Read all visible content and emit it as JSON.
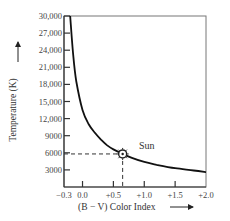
{
  "chart_data": {
    "type": "line",
    "title": "",
    "xlabel": "(B − V) Color Index",
    "ylabel": "Temperature (K)",
    "xlim": [
      -0.3,
      2.0
    ],
    "ylim": [
      0,
      30000
    ],
    "x_ticks": [
      "−0.3",
      "0.0",
      "+0.5",
      "+1.0",
      "+1.5",
      "+2.0"
    ],
    "x_tick_values": [
      -0.3,
      0.0,
      0.5,
      1.0,
      1.5,
      2.0
    ],
    "y_ticks": [
      "3000",
      "6000",
      "9000",
      "12,000",
      "15,000",
      "18,000",
      "21,000",
      "24,000",
      "27,000",
      "30,000"
    ],
    "y_tick_values": [
      3000,
      6000,
      9000,
      12000,
      15000,
      18000,
      21000,
      24000,
      27000,
      30000
    ],
    "grid": false,
    "legend": null,
    "series": [
      {
        "name": "Temperature vs. color index",
        "x": [
          -0.2,
          -0.15,
          -0.1,
          0.0,
          0.1,
          0.2,
          0.3,
          0.4,
          0.5,
          0.65,
          0.8,
          1.0,
          1.2,
          1.5,
          1.8,
          2.0
        ],
        "values": [
          30000,
          23000,
          18500,
          13500,
          11000,
          9500,
          8300,
          7300,
          6600,
          5800,
          5100,
          4400,
          3900,
          3300,
          2900,
          2600
        ]
      }
    ],
    "annotations": [
      {
        "label": "Sun",
        "x": 0.65,
        "y": 5800,
        "marker": "sun-symbol",
        "dashed_guides": true
      }
    ]
  },
  "labels": {
    "sun": "Sun",
    "xlabel": "(B − V) Color Index",
    "ylabel": "Temperature (K)"
  }
}
